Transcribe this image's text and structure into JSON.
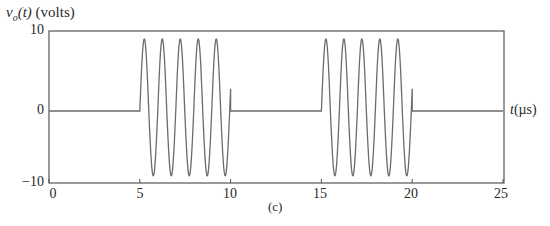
{
  "chart_data": {
    "type": "line",
    "title": "",
    "caption": "(c)",
    "ylabel": "v_o(t) (volts)",
    "ylabel_parts": {
      "var": "v",
      "sub": "o",
      "arg": "(t)",
      "unit": " (volts)"
    },
    "xlabel": "t(µs)",
    "xlabel_parts": {
      "var": "t",
      "unit": "(µs)"
    },
    "xlim": [
      0,
      25
    ],
    "ylim": [
      -10,
      10
    ],
    "xticks": [
      0,
      5,
      10,
      15,
      20,
      25
    ],
    "xtick_labels": [
      "0",
      "5",
      "10",
      "15",
      "20",
      "25"
    ],
    "yticks": [
      10,
      0,
      -10
    ],
    "ytick_labels": [
      "10",
      "0",
      "−10"
    ],
    "grid": false,
    "legend": null,
    "series": [
      {
        "name": "v_o(t)",
        "description": "Tone bursts: sinusoid of ~9 V amplitude, ~1 MHz, on for 5 µs every 10 µs; zero otherwise",
        "segments": [
          {
            "t_start": 0,
            "t_end": 5,
            "kind": "zero"
          },
          {
            "t_start": 5,
            "t_end": 10,
            "kind": "sine",
            "amplitude": 9,
            "frequency_mhz": 1.01,
            "phase": 0
          },
          {
            "t_start": 10,
            "t_end": 15,
            "kind": "zero"
          },
          {
            "t_start": 15,
            "t_end": 20,
            "kind": "sine",
            "amplitude": 9,
            "frequency_mhz": 1.01,
            "phase": 0
          },
          {
            "t_start": 20,
            "t_end": 25,
            "kind": "zero"
          }
        ],
        "peak_value": 9,
        "trough_value": -9,
        "end_of_burst_value": 2.9
      }
    ],
    "colors": {
      "line": "#6b6b6b",
      "axis": "#555555"
    }
  }
}
